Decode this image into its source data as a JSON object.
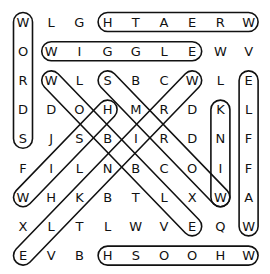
{
  "puzzle": {
    "grid": [
      [
        "W",
        "L",
        "G",
        "H",
        "T",
        "A",
        "E",
        "R",
        "W"
      ],
      [
        "O",
        "W",
        "I",
        "G",
        "G",
        "L",
        "E",
        "W",
        "V"
      ],
      [
        "R",
        "W",
        "L",
        "S",
        "B",
        "C",
        "W",
        "L",
        "E"
      ],
      [
        "D",
        "D",
        "O",
        "H",
        "M",
        "R",
        "D",
        "K",
        "L"
      ],
      [
        "S",
        "J",
        "S",
        "B",
        "I",
        "R",
        "D",
        "N",
        "F"
      ],
      [
        "F",
        "I",
        "L",
        "N",
        "B",
        "C",
        "O",
        "I",
        "F"
      ],
      [
        "W",
        "H",
        "K",
        "B",
        "T",
        "L",
        "X",
        "W",
        "A"
      ],
      [
        "X",
        "L",
        "T",
        "L",
        "W",
        "V",
        "E",
        "Q",
        "W"
      ],
      [
        "E",
        "V",
        "B",
        "H",
        "S",
        "O",
        "O",
        "H",
        "W"
      ]
    ],
    "found_words": [
      {
        "word": "WORDS",
        "start": [
          0,
          0
        ],
        "end": [
          4,
          0
        ]
      },
      {
        "word": "WREATH",
        "start": [
          0,
          8
        ],
        "end": [
          0,
          3
        ]
      },
      {
        "word": "WIGGLE",
        "start": [
          1,
          1
        ],
        "end": [
          1,
          6
        ]
      },
      {
        "word": "WOBBLE",
        "start": [
          2,
          1
        ],
        "end": [
          7,
          6
        ]
      },
      {
        "word": "WORMS",
        "start": [
          6,
          7
        ],
        "end": [
          2,
          3
        ]
      },
      {
        "word": "WRINKLE",
        "start": [
          2,
          6
        ],
        "end": [
          8,
          0
        ]
      },
      {
        "word": "WISH",
        "start": [
          6,
          0
        ],
        "end": [
          3,
          3
        ]
      },
      {
        "word": "WINK",
        "start": [
          6,
          7
        ],
        "end": [
          3,
          7
        ]
      },
      {
        "word": "WAFFLE",
        "start": [
          7,
          8
        ],
        "end": [
          2,
          8
        ]
      },
      {
        "word": "WHOOSH",
        "start": [
          8,
          8
        ],
        "end": [
          8,
          3
        ]
      }
    ],
    "outline_color": "#111111"
  }
}
